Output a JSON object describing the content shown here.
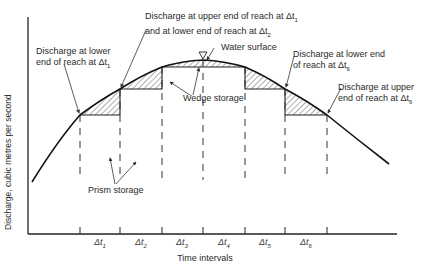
{
  "figure": {
    "y_axis_label": "Discharge, cubic metres per second",
    "x_axis_label": "Time intervals",
    "intervals": [
      "Δt1",
      "Δt2",
      "Δt3",
      "Δt4",
      "Δt5",
      "Δt6"
    ],
    "interval_labels_display": [
      {
        "base": "Δt",
        "sub": "1"
      },
      {
        "base": "Δt",
        "sub": "2"
      },
      {
        "base": "Δt",
        "sub": "3"
      },
      {
        "base": "Δt",
        "sub": "4"
      },
      {
        "base": "Δt",
        "sub": "5"
      },
      {
        "base": "Δt",
        "sub": "6"
      }
    ],
    "annotations": {
      "lower_dt1": {
        "line1": "Discharge at lower",
        "line2": "end of reach at Δt",
        "sub": "1"
      },
      "upper_dt1_lower_dt2": {
        "line1": "Discharge at upper end of reach at Δt",
        "sub1": "1",
        "line2": "and at lower end of reach at Δt",
        "sub2": "2"
      },
      "water_surface": "Water surface",
      "wedge_storage": "Wedge storage",
      "lower_dt6": {
        "line1": "Discharge at lower end",
        "line2": "of reach at Δt",
        "sub": "6"
      },
      "upper_dt6": {
        "line1": "Discharge at upper",
        "line2": "end of reach at Δt",
        "sub": "6"
      },
      "prism_storage": "Prism storage"
    },
    "water_surface_symbol": "▽"
  }
}
